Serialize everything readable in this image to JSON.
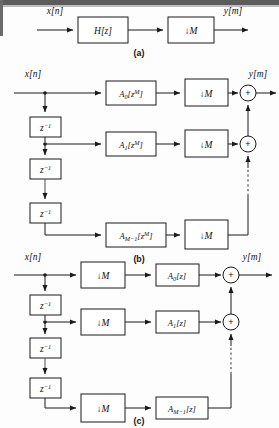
{
  "figure": {
    "captions": {
      "a": "(a)",
      "b": "(b)",
      "c": "(c)"
    }
  },
  "signals": {
    "input": "x[n]",
    "output": "y[m]"
  },
  "panel_a": {
    "caption": "(a)",
    "blocks": [
      {
        "id": "filter",
        "label": "H[z]"
      },
      {
        "id": "decimator",
        "label": "↓M"
      }
    ],
    "input_label": "x[n]",
    "output_label": "y[m]"
  },
  "panel_b": {
    "caption": "(b)",
    "input_label": "x[n]",
    "output_label": "y[m]",
    "delay_label": "z",
    "delay_exponent": "−1",
    "delay_count": 3,
    "branches": [
      {
        "filter_base": "A",
        "filter_index": "0",
        "filter_arg": "[z",
        "filter_argsup": "M",
        "filter_argend": "]",
        "filter_full": "A0[zM]",
        "decimator": "↓M"
      },
      {
        "filter_base": "A",
        "filter_index": "1",
        "filter_arg": "[z",
        "filter_argsup": "M",
        "filter_argend": "]",
        "filter_full": "A1[zM]",
        "decimator": "↓M"
      },
      {
        "filter_base": "A",
        "filter_index": "M−1",
        "filter_arg": "[z",
        "filter_argsup": "M",
        "filter_argend": "]",
        "filter_full": "AM-1[zM]",
        "decimator": "↓M"
      }
    ],
    "adders": [
      {
        "label": "+"
      },
      {
        "label": "+"
      }
    ],
    "ellipsis": "vertical-dashed-line"
  },
  "panel_c": {
    "caption": "(c)",
    "input_label": "x[n]",
    "output_label": "y[m]",
    "delay_label": "z",
    "delay_exponent": "−1",
    "delay_count": 3,
    "branches": [
      {
        "decimator": "↓M",
        "filter_base": "A",
        "filter_index": "0",
        "filter_arg": "[z]",
        "filter_full": "A0[z]"
      },
      {
        "decimator": "↓M",
        "filter_base": "A",
        "filter_index": "1",
        "filter_arg": "[z]",
        "filter_full": "A1[z]"
      },
      {
        "decimator": "↓M",
        "filter_base": "A",
        "filter_index": "M−1",
        "filter_arg": "[z]",
        "filter_full": "AM-1[z]"
      }
    ],
    "adders": [
      {
        "label": "+"
      },
      {
        "label": "+"
      }
    ],
    "ellipsis": "vertical-dashed-line"
  },
  "colors": {
    "line": "#1a1a1a",
    "box_fill": "#ffffff",
    "background": "#fdfdfd",
    "band": "#5c5c5c"
  }
}
